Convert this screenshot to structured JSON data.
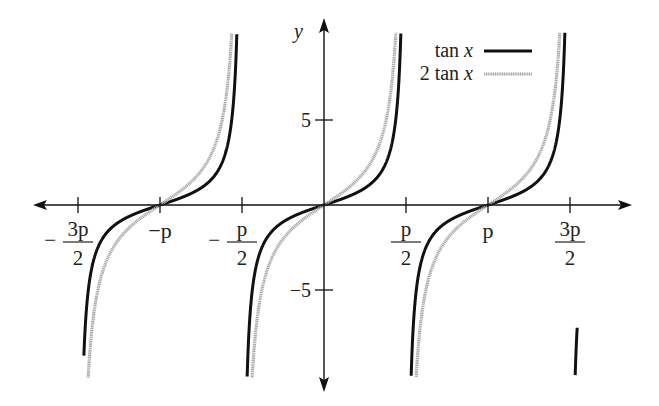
{
  "chart_data": {
    "type": "line",
    "title": "",
    "xlabel": "",
    "ylabel": "y",
    "xlim": [
      -5.2,
      6.3
    ],
    "ylim": [
      -10.2,
      10.2
    ],
    "grid": false,
    "legend_position": "upper right",
    "x_ticks": [
      {
        "value": -4.712,
        "label_num": "3p",
        "label_den": "2",
        "sign": "−"
      },
      {
        "value": -3.1416,
        "label": "−p"
      },
      {
        "value": -1.5708,
        "label_num": "p",
        "label_den": "2",
        "sign": "−"
      },
      {
        "value": 1.5708,
        "label_num": "p",
        "label_den": "2",
        "sign": ""
      },
      {
        "value": 3.1416,
        "label": "p"
      },
      {
        "value": 4.712,
        "label_num": "3p",
        "label_den": "2",
        "sign": ""
      }
    ],
    "y_ticks": [
      {
        "value": 5,
        "label": "5"
      },
      {
        "value": -5,
        "label": "−5"
      }
    ],
    "series": [
      {
        "name": "tan x",
        "function": "tan(x)",
        "color": "#111111",
        "style": "solid-black"
      },
      {
        "name": "2 tan x",
        "function": "2*tan(x)",
        "color": "#a8a8a8",
        "style": "gray-textured"
      }
    ],
    "x_domain": [
      -4.6,
      4.85
    ]
  },
  "legend": {
    "items": [
      {
        "label": "tan x"
      },
      {
        "label": "2 tan x"
      }
    ]
  },
  "axes": {
    "y_label": "y"
  }
}
